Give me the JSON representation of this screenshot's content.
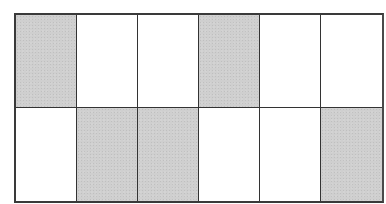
{
  "diagram": {
    "type": "shaded-grid",
    "rows": 2,
    "columns": 6,
    "shade_color": "#cfcfcf",
    "unshaded_color": "#ffffff",
    "line_color": "#333333",
    "cells": [
      [
        true,
        false,
        false,
        true,
        false,
        false
      ],
      [
        false,
        true,
        true,
        false,
        false,
        true
      ]
    ],
    "shaded_count": 5,
    "total_count": 12
  }
}
